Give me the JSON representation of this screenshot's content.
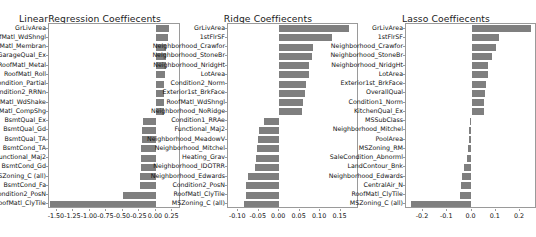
{
  "figure": {
    "width": 536,
    "height": 237,
    "background": "#ffffff",
    "bar_color": "#7f7f7f",
    "axis_color": "#9a9a9a"
  },
  "chart_data": [
    {
      "type": "bar",
      "orientation": "horizontal",
      "title": "LinearRegression Coeffiecents",
      "xlabel": "",
      "ylabel": "",
      "xlim": [
        -1.62,
        0.38
      ],
      "grid": false,
      "legend": "none",
      "xticks": [
        "-1.50",
        "-1.25",
        "-1.00",
        "-0.75",
        "-0.50",
        "-0.25",
        "0.00",
        "0.25"
      ],
      "xtickvalues": [
        -1.5,
        -1.25,
        -1.0,
        -0.75,
        -0.5,
        -0.25,
        0.0,
        0.25
      ],
      "categories": [
        "GrLivArea",
        "RoofMatl_WdShngl",
        "RoofMatl_Membran",
        "GarageQual_Ex",
        "RoofMatl_Metal",
        "RoofMatl_Roll",
        "SaleCondition_Partial",
        "Condition2_RRNn",
        "RoofMatl_WdShake",
        "RoofMatl_CompShg",
        "BsmtQual_Ex",
        "BsmtQual_Gd",
        "BsmtQual_TA",
        "BsmtCond_TA",
        "Functional_Maj2",
        "BsmtCond_Gd",
        "MSZoning_C (all)",
        "BsmtCond_Fa",
        "Condition2_PosN",
        "RoofMatl_ClyTile"
      ],
      "values": [
        0.205,
        0.185,
        0.155,
        0.15,
        0.148,
        0.132,
        0.128,
        0.125,
        0.12,
        0.118,
        -0.19,
        -0.205,
        -0.215,
        -0.22,
        -0.225,
        -0.23,
        -0.235,
        -0.24,
        -0.5,
        -1.6
      ]
    },
    {
      "type": "bar",
      "orientation": "horizontal",
      "title": "Ridge Coeffiecents",
      "xlabel": "",
      "ylabel": "",
      "xlim": [
        -0.125,
        0.195
      ],
      "grid": false,
      "legend": "none",
      "xticks": [
        "-0.10",
        "-0.05",
        "0.00",
        "0.05",
        "0.10",
        "0.15"
      ],
      "xtickvalues": [
        -0.1,
        -0.05,
        0.0,
        0.05,
        0.1,
        0.15
      ],
      "categories": [
        "GrLivArea",
        "1stFlrSF",
        "Neighborhood_Crawfor",
        "Neighborhood_StoneBr",
        "Neighborhood_NridgHt",
        "LotArea",
        "Condition2_Norm",
        "Exterior1st_BrkFace",
        "RoofMatl_WdShngl",
        "Neighborhood_NoRidge",
        "Condition1_RRAe",
        "Functional_Maj2",
        "Neighborhood_MeadowV",
        "Neighborhood_Mitchel",
        "Heating_Grav",
        "Neighborhood_IDOTRR",
        "Neighborhood_Edwards",
        "Condition2_PosN",
        "RoofMatl_ClyTile",
        "MSZoning_C (all)"
      ],
      "values": [
        0.17,
        0.128,
        0.082,
        0.08,
        0.073,
        0.072,
        0.066,
        0.063,
        0.058,
        0.056,
        -0.036,
        -0.05,
        -0.052,
        -0.055,
        -0.057,
        -0.06,
        -0.075,
        -0.08,
        -0.082,
        -0.085
      ]
    },
    {
      "type": "bar",
      "orientation": "horizontal",
      "title": "Lasso Coeffiecents",
      "xlabel": "",
      "ylabel": "",
      "xlim": [
        -0.27,
        0.27
      ],
      "grid": false,
      "legend": "none",
      "xticks": [
        "-0.2",
        "-0.1",
        "0.0",
        "0.1",
        "0.2"
      ],
      "xtickvalues": [
        -0.2,
        -0.1,
        0.0,
        0.1,
        0.2
      ],
      "categories": [
        "GrLivArea",
        "1stFlrSF",
        "Neighborhood_Crawfor",
        "Neighborhood_StoneBr",
        "Neighborhood_NridgHt",
        "LotArea",
        "Exterior1st_BrkFace",
        "OverallQual",
        "Condition1_Norm",
        "KitchenQual_Ex",
        "MSSubClass",
        "Neighborhood_Mitchel",
        "PoolArea",
        "MSZoning_RM",
        "SaleCondition_Abnorml",
        "LandContour_Bnk",
        "Neighborhood_Edwards",
        "CentralAir_N",
        "RoofMatl_ClyTile",
        "MSZoning_C (all)"
      ],
      "values": [
        0.246,
        0.113,
        0.101,
        0.085,
        0.07,
        0.067,
        0.061,
        0.055,
        0.053,
        0.05,
        -0.008,
        -0.01,
        -0.012,
        -0.015,
        -0.018,
        -0.03,
        -0.038,
        -0.043,
        -0.048,
        -0.25
      ]
    }
  ]
}
